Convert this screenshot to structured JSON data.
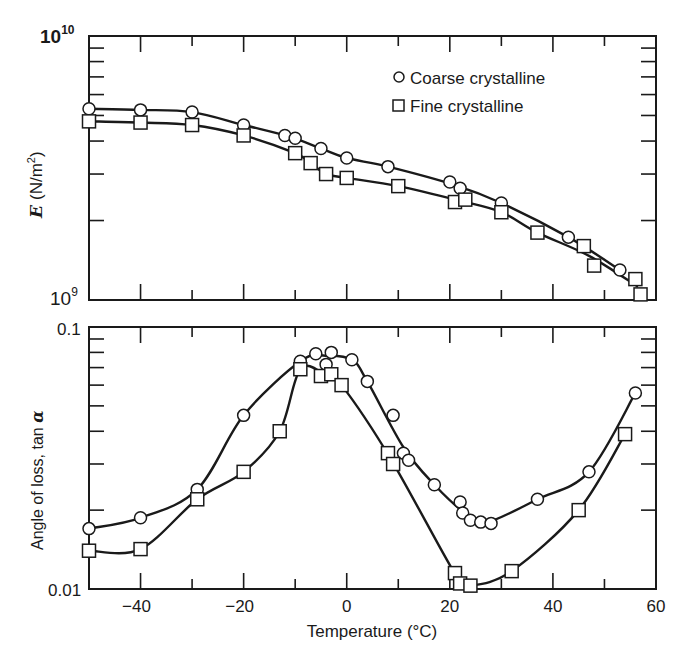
{
  "chart_data": [
    {
      "type": "line",
      "panel": "top",
      "title": "",
      "xlabel": "",
      "ylabel": "E (N/m²)",
      "yscale": "log",
      "ylim": [
        1000000000.0,
        10000000000.0
      ],
      "xlim": [
        -50,
        60
      ],
      "ytick_labels": [
        "10^10",
        "10^9"
      ],
      "grid": false,
      "legend": {
        "position": "upper right",
        "entries": [
          "Coarse crystalline",
          "Fine crystalline"
        ]
      },
      "series": [
        {
          "name": "Coarse crystalline",
          "marker": "circle",
          "x": [
            -50,
            -40,
            -30,
            -20,
            -12,
            -10,
            -5,
            0,
            8,
            20,
            22,
            30,
            43,
            53
          ],
          "y": [
            5300000000.0,
            5250000000.0,
            5150000000.0,
            4600000000.0,
            4200000000.0,
            4100000000.0,
            3750000000.0,
            3450000000.0,
            3200000000.0,
            2800000000.0,
            2650000000.0,
            2330000000.0,
            1730000000.0,
            1300000000.0
          ]
        },
        {
          "name": "Fine crystalline",
          "marker": "square",
          "x": [
            -50,
            -40,
            -30,
            -20,
            -10,
            -7,
            -4,
            0,
            10,
            21,
            23,
            30,
            37,
            46,
            48,
            56,
            57
          ],
          "y": [
            4750000000.0,
            4700000000.0,
            4600000000.0,
            4200000000.0,
            3600000000.0,
            3300000000.0,
            3000000000.0,
            2900000000.0,
            2700000000.0,
            2350000000.0,
            2400000000.0,
            2150000000.0,
            1800000000.0,
            1600000000.0,
            1350000000.0,
            1200000000.0,
            1050000000.0
          ]
        }
      ]
    },
    {
      "type": "line",
      "panel": "bottom",
      "title": "",
      "xlabel": "Temperature (°C)",
      "ylabel": "Angle of loss, tan α",
      "yscale": "log",
      "ylim": [
        0.01,
        0.1
      ],
      "xlim": [
        -50,
        60
      ],
      "xticks": [
        -40,
        -20,
        0,
        20,
        40,
        60
      ],
      "ytick_labels": [
        "0.1",
        "0.01"
      ],
      "grid": false,
      "series": [
        {
          "name": "Coarse crystalline",
          "marker": "circle",
          "x": [
            -50,
            -40,
            -29,
            -20,
            -9,
            -6,
            -4,
            -3,
            1,
            4,
            9,
            11,
            12,
            17,
            22,
            22.5,
            24,
            26,
            28,
            37,
            47,
            56
          ],
          "y": [
            0.017,
            0.0187,
            0.024,
            0.046,
            0.074,
            0.079,
            0.072,
            0.08,
            0.075,
            0.062,
            0.046,
            0.033,
            0.031,
            0.025,
            0.0215,
            0.0195,
            0.0183,
            0.018,
            0.0178,
            0.022,
            0.028,
            0.056
          ]
        },
        {
          "name": "Fine crystalline",
          "marker": "square",
          "x": [
            -50,
            -40,
            -29,
            -20,
            -13,
            -9,
            -5,
            -3,
            -1,
            8,
            9,
            21,
            22,
            24,
            32,
            45,
            54
          ],
          "y": [
            0.014,
            0.0142,
            0.022,
            0.028,
            0.04,
            0.069,
            0.065,
            0.066,
            0.06,
            0.033,
            0.03,
            0.0115,
            0.0105,
            0.0103,
            0.0117,
            0.02,
            0.039
          ]
        }
      ]
    }
  ],
  "labels": {
    "top_ylabel_symbol": "E",
    "top_ylabel_unit": "(N/m",
    "top_ylabel_sup": "2",
    "top_ylabel_close": ")",
    "top_ytick_hi_base": "10",
    "top_ytick_hi_exp": "10",
    "top_ytick_lo_base": "10",
    "top_ytick_lo_exp": "9",
    "bottom_ylabel": "Angle of loss, tan ",
    "bottom_ylabel_alpha": "α",
    "bottom_ytick_hi": "0.1",
    "bottom_ytick_lo": "0.01",
    "xlabel": "Temperature (°C)",
    "xticks": [
      "−40",
      "−20",
      "0",
      "20",
      "40",
      "60"
    ],
    "legend_coarse": "Coarse crystalline",
    "legend_fine": "Fine crystalline"
  }
}
